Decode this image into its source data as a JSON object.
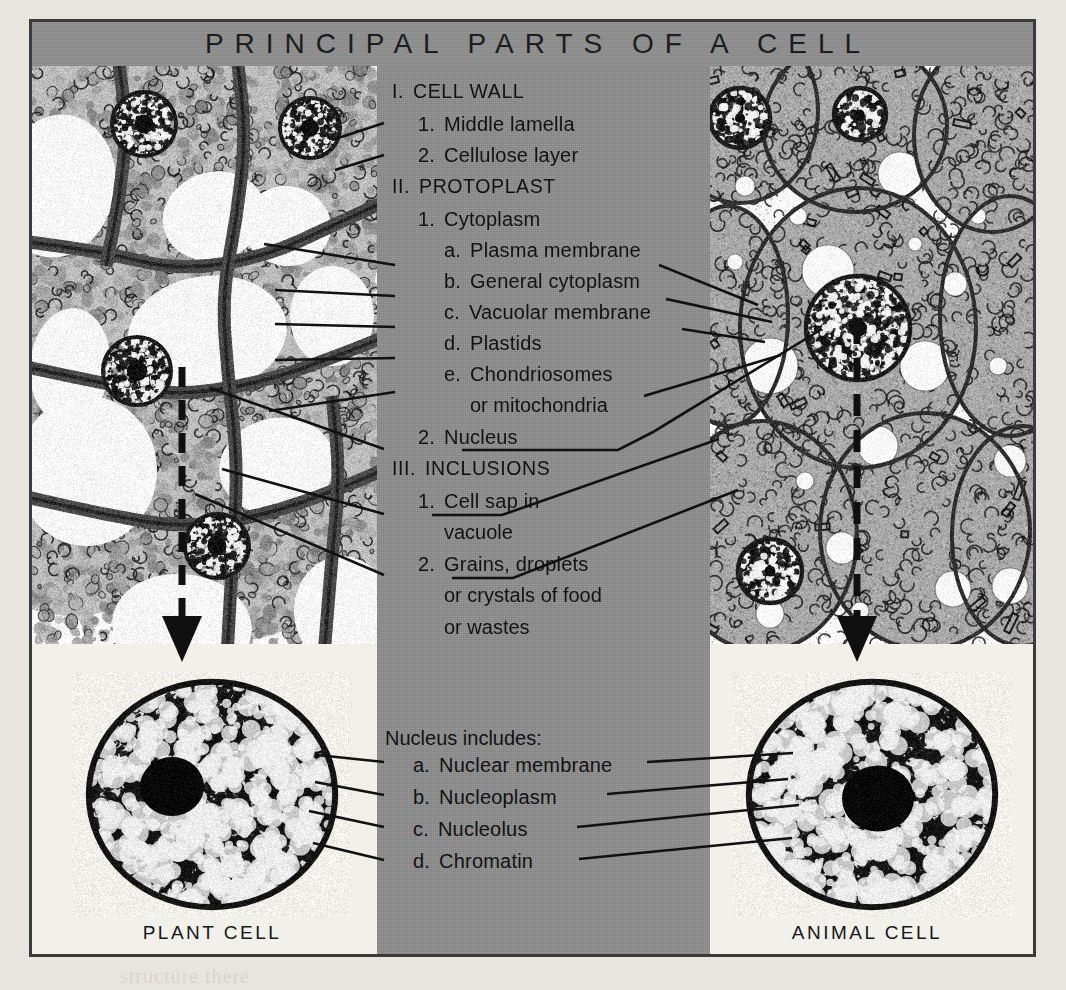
{
  "title": "PRINCIPAL PARTS OF A CELL",
  "panels": {
    "plant_caption": "PLANT CELL",
    "animal_caption": "ANIMAL CELL"
  },
  "outline": [
    {
      "id": "cell-wall",
      "marker": "I.",
      "text": "CELL WALL",
      "level": 0,
      "style": "roman"
    },
    {
      "id": "middle-lamella",
      "marker": "1.",
      "text": "Middle lamella",
      "level": 1,
      "style": "num"
    },
    {
      "id": "cellulose-layer",
      "marker": "2.",
      "text": "Cellulose layer",
      "level": 1,
      "style": "num"
    },
    {
      "id": "protoplast",
      "marker": "II.",
      "text": "PROTOPLAST",
      "level": 0,
      "style": "roman"
    },
    {
      "id": "cytoplasm",
      "marker": "1.",
      "text": "Cytoplasm",
      "level": 1,
      "style": "num"
    },
    {
      "id": "plasma-membrane",
      "marker": "a.",
      "text": "Plasma membrane",
      "level": 2,
      "style": "alpha"
    },
    {
      "id": "general-cytoplasm",
      "marker": "b.",
      "text": "General cytoplasm",
      "level": 2,
      "style": "alpha"
    },
    {
      "id": "vacuolar-membrane",
      "marker": "c.",
      "text": "Vacuolar membrane",
      "level": 2,
      "style": "alpha"
    },
    {
      "id": "plastids",
      "marker": "d.",
      "text": "Plastids",
      "level": 2,
      "style": "alpha"
    },
    {
      "id": "chondriosomes",
      "marker": "e.",
      "text": "Chondriosomes",
      "level": 2,
      "style": "alpha"
    },
    {
      "id": "mitochondria-cont",
      "marker": "",
      "text": "or mitochondria",
      "level": 3,
      "style": "cont"
    },
    {
      "id": "nucleus",
      "marker": "2.",
      "text": "Nucleus",
      "level": 1,
      "style": "num"
    },
    {
      "id": "inclusions",
      "marker": "III.",
      "text": "INCLUSIONS",
      "level": 0,
      "style": "roman"
    },
    {
      "id": "cell-sap",
      "marker": "1.",
      "text": "Cell sap in",
      "level": 1,
      "style": "num"
    },
    {
      "id": "vacuole-cont",
      "marker": "",
      "text": "vacuole",
      "level": 2,
      "style": "cont"
    },
    {
      "id": "grains-droplets",
      "marker": "2.",
      "text": "Grains, droplets",
      "level": 1,
      "style": "num"
    },
    {
      "id": "crystals-cont",
      "marker": "",
      "text": "or crystals of food",
      "level": 2,
      "style": "cont"
    },
    {
      "id": "wastes-cont",
      "marker": "",
      "text": "or wastes",
      "level": 2,
      "style": "cont"
    }
  ],
  "nucleus_section": {
    "heading": "Nucleus includes:",
    "items": [
      {
        "id": "nuclear-membrane",
        "marker": "a.",
        "text": "Nuclear membrane"
      },
      {
        "id": "nucleoplasm",
        "marker": "b.",
        "text": "Nucleoplasm"
      },
      {
        "id": "nucleolus",
        "marker": "c.",
        "text": "Nucleolus"
      },
      {
        "id": "chromatin",
        "marker": "d.",
        "text": "Chromatin"
      }
    ]
  },
  "colors": {
    "panel_gray": "#8e8e8e",
    "paper": "#f2f0ea",
    "page_background": "#e8e5de",
    "ink": "#121212",
    "frame": "#3b3b3b"
  },
  "bleed_through": [
    "the lowest forms of",
    "in the microscope",
    "structure there"
  ]
}
